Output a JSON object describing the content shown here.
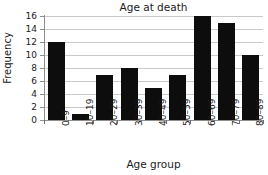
{
  "chart_data": {
    "type": "bar",
    "title": "Age at death",
    "xlabel": "Age group",
    "ylabel": "Frequency",
    "categories": [
      "0–9",
      "10–19",
      "20–29",
      "30–39",
      "40–49",
      "50–59",
      "60–69",
      "70–79",
      "80–89"
    ],
    "values": [
      12,
      1,
      7,
      8,
      5,
      7,
      16,
      15,
      10
    ],
    "ylim": [
      0,
      16
    ],
    "yticks": [
      0,
      2,
      4,
      6,
      8,
      10,
      12,
      14,
      16
    ],
    "ytick_labels": [
      "0",
      "2",
      "4",
      "6",
      "8",
      "10",
      "12",
      "14",
      "16"
    ],
    "grid": true,
    "grid_axis": "y",
    "legend": null,
    "bar_color": "#0d0d0d",
    "grid_color": "#c9c9c9",
    "axis_color": "#8f8f8f",
    "background_color": "#ffffff",
    "text_color": "#1a1a1a",
    "xtick_rotation": 90
  }
}
